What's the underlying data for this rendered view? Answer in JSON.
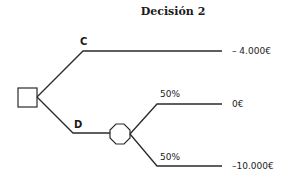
{
  "title": "Decisión 2",
  "decision_node": {
    "shape": "square"
  },
  "branches": {
    "c": {
      "label": "C",
      "payoff": "– 4.000€"
    },
    "d": {
      "label": "D",
      "chance_node": {
        "shape": "octagon"
      },
      "outcomes": [
        {
          "probability": "50%",
          "payoff": "0€"
        },
        {
          "probability": "50%",
          "payoff": "–10.000€"
        }
      ]
    }
  },
  "colors": {
    "line": "#2a2a2a",
    "text": "#1a1a1a",
    "background": "#ffffff"
  }
}
